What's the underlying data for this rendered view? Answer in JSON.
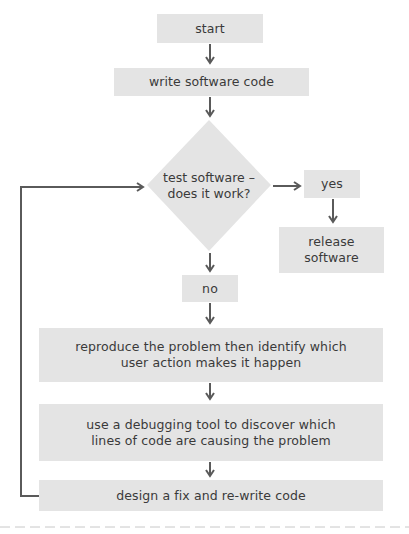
{
  "flowchart": {
    "title": "software debugging flowchart",
    "nodes": {
      "start": "start",
      "write": "write software code",
      "decision_line1": "test software –",
      "decision_line2": "does it work?",
      "yes": "yes",
      "release_line1": "release",
      "release_line2": "software",
      "no": "no",
      "reproduce_line1": "reproduce the problem then identify which",
      "reproduce_line2": "user action makes it happen",
      "debug_line1": "use a debugging tool to discover which",
      "debug_line2": "lines of code are causing the problem",
      "design": "design a fix and re-write code"
    },
    "edges": [
      {
        "from": "start",
        "to": "write"
      },
      {
        "from": "write",
        "to": "decision"
      },
      {
        "from": "decision",
        "to": "yes"
      },
      {
        "from": "yes",
        "to": "release"
      },
      {
        "from": "decision",
        "to": "no"
      },
      {
        "from": "no",
        "to": "reproduce"
      },
      {
        "from": "reproduce",
        "to": "debug"
      },
      {
        "from": "debug",
        "to": "design"
      },
      {
        "from": "design",
        "to": "decision",
        "type": "loop-back"
      }
    ],
    "colors": {
      "box_fill": "#e4e4e4",
      "arrow": "#5a5a5a",
      "text": "#3a3a3a",
      "dashed_divider": "#c8c8c8"
    }
  }
}
